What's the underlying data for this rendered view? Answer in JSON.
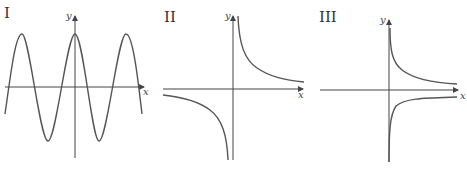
{
  "figure": {
    "panels": [
      {
        "id": "I",
        "label": "I",
        "x_axis_label": "x",
        "y_axis_label": "y",
        "curve": "cosine",
        "description": "periodic cosine-like wave, maximum on y-axis"
      },
      {
        "id": "II",
        "label": "II",
        "x_axis_label": "x",
        "y_axis_label": "y",
        "curve": "reciprocal",
        "description": "hyperbola y = k/x with branches in quadrants I and III"
      },
      {
        "id": "III",
        "label": "III",
        "x_axis_label": "x",
        "y_axis_label": "y",
        "curve": "plus-minus-reciprocal-sqrt",
        "description": "two branches on x > 0, one above and one below the x-axis, approaching the axis asymptotically"
      }
    ],
    "colors": {
      "curve": "#555555",
      "axis": "#444444",
      "text": "#333333",
      "background": "#ffffff"
    }
  }
}
